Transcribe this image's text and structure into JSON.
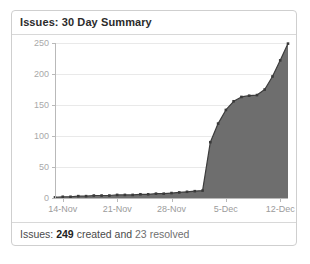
{
  "panel": {
    "title": "Issues: 30 Day Summary",
    "footer": {
      "prefix": "Issues:",
      "created_count": "249",
      "middle": "created and",
      "resolved_count": "23",
      "suffix": "resolved"
    }
  },
  "colors": {
    "panel_border": "#cfcfcf",
    "separator": "#d8d8d8",
    "title_text": "#2b2b2b",
    "area_fill": "#6e6e6e",
    "series_line": "#3d3d3d",
    "grid": "#e9e9e9",
    "axis": "#b9b9b9",
    "tick_label": "#a9a9a9"
  },
  "chart_data": {
    "type": "area",
    "title": "Issues: 30 Day Summary",
    "xlabel": "",
    "ylabel": "",
    "ylim": [
      0,
      250
    ],
    "yticks": [
      0,
      50,
      100,
      150,
      200,
      250
    ],
    "ytick_labels": [
      "0",
      "50",
      "100",
      "150",
      "200",
      "250"
    ],
    "grid": true,
    "legend": false,
    "x": [
      "13-Nov",
      "14-Nov",
      "15-Nov",
      "16-Nov",
      "17-Nov",
      "18-Nov",
      "19-Nov",
      "20-Nov",
      "21-Nov",
      "22-Nov",
      "23-Nov",
      "24-Nov",
      "25-Nov",
      "26-Nov",
      "27-Nov",
      "28-Nov",
      "29-Nov",
      "30-Nov",
      "1-Dec",
      "2-Dec",
      "3-Dec",
      "4-Dec",
      "5-Dec",
      "6-Dec",
      "7-Dec",
      "8-Dec",
      "9-Dec",
      "10-Dec",
      "11-Dec",
      "12-Dec",
      "13-Dec"
    ],
    "xtick_labels": [
      "14-Nov",
      "21-Nov",
      "28-Nov",
      "5-Dec",
      "12-Dec"
    ],
    "xtick_indices": [
      1,
      8,
      15,
      22,
      29
    ],
    "series": [
      {
        "name": "Created (cumulative)",
        "values": [
          1,
          2,
          2,
          3,
          3,
          4,
          4,
          4,
          5,
          5,
          5,
          6,
          6,
          7,
          7,
          8,
          9,
          10,
          11,
          12,
          90,
          120,
          142,
          156,
          163,
          165,
          166,
          175,
          196,
          222,
          249
        ]
      }
    ],
    "annotations": {
      "created_total": 249,
      "resolved_total": 23,
      "peak_value": 249,
      "plateau_value": 165
    }
  }
}
